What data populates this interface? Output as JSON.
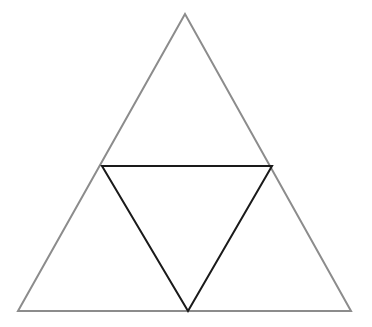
{
  "diagram": {
    "title": "",
    "background": "#ffffff",
    "outer_triangle": {
      "points": [
        [
          185,
          14
        ],
        [
          18,
          311
        ],
        [
          351,
          311
        ]
      ],
      "stroke": "#8c8c8c",
      "stroke_width": 2
    },
    "inner_triangle": {
      "points": [
        [
          102,
          166
        ],
        [
          272,
          166
        ],
        [
          188,
          311
        ]
      ],
      "stroke": "#1a1a1a",
      "stroke_width": 2
    }
  }
}
